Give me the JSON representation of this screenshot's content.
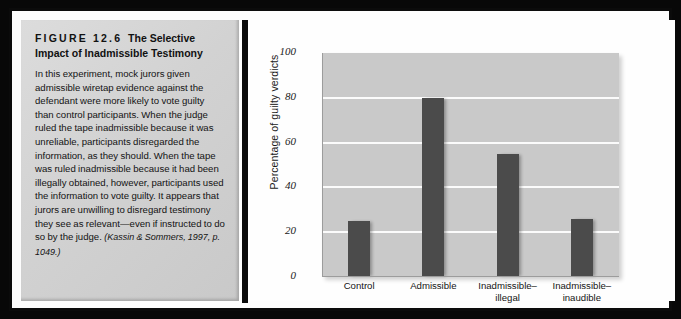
{
  "figure": {
    "number": "FIGURE 12.6",
    "title": "The Selective Impact of Inadmissible Testimony",
    "body": "In this experiment, mock jurors given admissible wiretap evidence against the defendant were more likely to vote guilty than control participants. When the judge ruled the tape inadmissible because it was unreliable, participants disregarded the information, as they should. When the tape was ruled inadmissible because it had been illegally obtained, however, participants used the information to vote guilty. It appears that jurors are unwilling to disregard testimony they see as relevant—even if instructed to do so by the judge.",
    "citation": "(Kassin & Sommers, 1997, p. 1049.)"
  },
  "chart_data": {
    "type": "bar",
    "title": "",
    "xlabel": "",
    "ylabel": "Percentage of guilty verdicts",
    "categories": [
      "Control",
      "Inadmissible–illegal",
      "Admissible",
      "Inadmissible–inaudible"
    ],
    "category_lines": [
      [
        "Control"
      ],
      [
        "Admissible"
      ],
      [
        "Inadmissible–",
        "illegal"
      ],
      [
        "Inadmissible–",
        "inaudible"
      ]
    ],
    "values": [
      25,
      80,
      55,
      26
    ],
    "ylim": [
      0,
      100
    ],
    "yticks": [
      0,
      20,
      40,
      60,
      80,
      100
    ],
    "ytick_labels": [
      "0",
      "20",
      "40",
      "60",
      "80",
      "100"
    ],
    "grid": true,
    "gridlines_at": [
      20,
      40,
      60,
      80
    ],
    "legend": null,
    "bar_color": "#4b4b4b",
    "plot_background": "#c9c9c9",
    "gridline_color": "#fbfbfb"
  }
}
